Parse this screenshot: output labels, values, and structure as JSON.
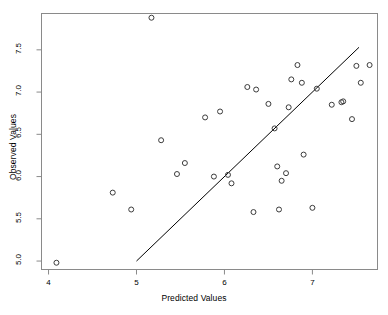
{
  "chart_data": {
    "type": "scatter",
    "title": "",
    "xlabel": "Predicted Values",
    "ylabel": "Observed Values",
    "xlim": [
      3.92,
      7.74
    ],
    "ylim": [
      4.9,
      7.93
    ],
    "xticks": [
      4,
      5,
      6,
      7
    ],
    "xtick_labels": [
      "4",
      "5",
      "6",
      "7"
    ],
    "yticks": [
      5.0,
      5.5,
      6.0,
      6.5,
      7.0,
      7.5
    ],
    "ytick_labels": [
      "5.0",
      "5.5",
      "6.0",
      "6.5",
      "7.0",
      "7.5"
    ],
    "grid": false,
    "legend": null,
    "point_marker": "open-circle",
    "point_color": "#3c3c3c",
    "line_color": "#000000",
    "frame_color": "#8a8a8a",
    "background": "#ffffff",
    "points": [
      {
        "x": 4.09,
        "y": 4.98
      },
      {
        "x": 4.73,
        "y": 5.81
      },
      {
        "x": 4.94,
        "y": 5.61
      },
      {
        "x": 5.17,
        "y": 7.88
      },
      {
        "x": 5.28,
        "y": 6.43
      },
      {
        "x": 5.46,
        "y": 6.03
      },
      {
        "x": 5.55,
        "y": 6.16
      },
      {
        "x": 5.78,
        "y": 6.7
      },
      {
        "x": 5.88,
        "y": 6.0
      },
      {
        "x": 5.95,
        "y": 6.77
      },
      {
        "x": 6.04,
        "y": 6.02
      },
      {
        "x": 6.08,
        "y": 5.92
      },
      {
        "x": 6.26,
        "y": 7.06
      },
      {
        "x": 6.33,
        "y": 5.58
      },
      {
        "x": 6.36,
        "y": 7.03
      },
      {
        "x": 6.5,
        "y": 6.86
      },
      {
        "x": 6.57,
        "y": 6.57
      },
      {
        "x": 6.6,
        "y": 6.12
      },
      {
        "x": 6.62,
        "y": 5.61
      },
      {
        "x": 6.65,
        "y": 5.95
      },
      {
        "x": 6.7,
        "y": 6.04
      },
      {
        "x": 6.73,
        "y": 6.82
      },
      {
        "x": 6.76,
        "y": 7.15
      },
      {
        "x": 6.83,
        "y": 7.32
      },
      {
        "x": 6.88,
        "y": 7.11
      },
      {
        "x": 6.9,
        "y": 6.26
      },
      {
        "x": 7.0,
        "y": 5.63
      },
      {
        "x": 7.05,
        "y": 7.04
      },
      {
        "x": 7.22,
        "y": 6.85
      },
      {
        "x": 7.33,
        "y": 6.88
      },
      {
        "x": 7.35,
        "y": 6.89
      },
      {
        "x": 7.45,
        "y": 6.68
      },
      {
        "x": 7.5,
        "y": 7.31
      },
      {
        "x": 7.55,
        "y": 7.11
      },
      {
        "x": 7.65,
        "y": 7.32
      }
    ],
    "reference_line": {
      "label": "identity-line",
      "x0": 5.0,
      "y0": 5.0,
      "x1": 7.53,
      "y1": 7.53
    }
  }
}
